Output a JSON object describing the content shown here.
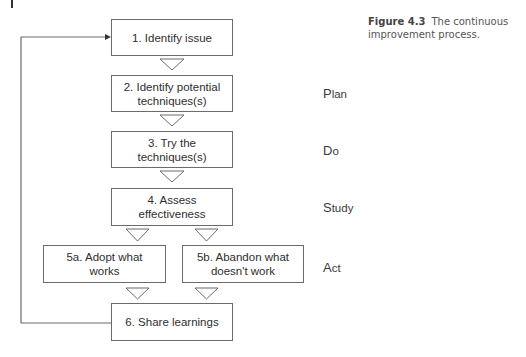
{
  "caption": {
    "label": "Figure 4.3",
    "text": "The continuous improvement process."
  },
  "steps": {
    "s1": "1. Identify issue",
    "s2": "2. Identify potential techniques(s)",
    "s3": "3. Try the techniques(s)",
    "s4": "4. Assess effectiveness",
    "s5a": "5a. Adopt what works",
    "s5b": "5b. Abandon what doesn't work",
    "s6": "6. Share learnings"
  },
  "phases": {
    "plan": {
      "initial": "P",
      "rest": "lan"
    },
    "do": {
      "initial": "D",
      "rest": "o"
    },
    "study": {
      "initial": "S",
      "rest": "tudy"
    },
    "act": {
      "initial": "A",
      "rest": "ct"
    }
  },
  "colors": {
    "line": "#6b6b6b",
    "text": "#2e2e2e"
  }
}
